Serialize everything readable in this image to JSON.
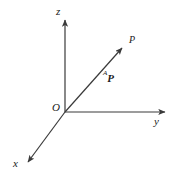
{
  "figure": {
    "kind": "coordinate-frame-vector-diagram",
    "width": 180,
    "height": 182,
    "background_color": "#ffffff",
    "line_color": "#3a3a3a",
    "text_color": "#1a1a1a"
  },
  "origin": {
    "label": "O",
    "x": 65,
    "y": 112
  },
  "axes": [
    {
      "id": "z",
      "label": "z",
      "label_x": 56,
      "label_y": 6,
      "from_x": 65,
      "from_y": 112,
      "to_x": 65,
      "to_y": 17,
      "arrow": true,
      "direction": "up"
    },
    {
      "id": "y",
      "label": "y",
      "label_x": 154,
      "label_y": 116,
      "from_x": 65,
      "from_y": 112,
      "to_x": 168,
      "to_y": 112,
      "arrow": true,
      "direction": "right"
    },
    {
      "id": "x",
      "label": "x",
      "label_x": 13,
      "label_y": 158,
      "from_x": 65,
      "from_y": 112,
      "to_x": 25,
      "to_y": 166,
      "arrow": true,
      "direction": "down-left"
    }
  ],
  "vector": {
    "id": "position-vector",
    "frame_superscript": "A",
    "name": "P",
    "label_x": 103,
    "label_y": 69,
    "from_x": 65,
    "from_y": 112,
    "to_x": 125,
    "to_y": 45,
    "arrow": true
  },
  "point": {
    "label": "P",
    "label_x": 129,
    "label_y": 35,
    "x": 125,
    "y": 45
  }
}
